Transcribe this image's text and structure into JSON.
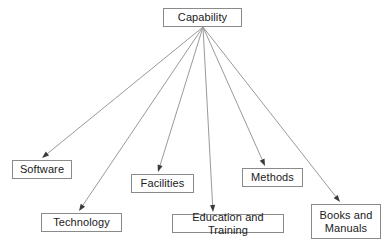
{
  "diagram": {
    "background_color": "#ffffff",
    "node_fill_color": "#ffffff",
    "node_border_color": "#8a8a8a",
    "edge_color": "#9a9a9a",
    "text_color": "#1a1a1a",
    "root": {
      "id": "capability",
      "label": "Capability",
      "x": 163,
      "y": 8,
      "w": 79,
      "h": 19
    },
    "nodes": [
      {
        "id": "software",
        "label": "Software",
        "x": 12,
        "y": 160,
        "w": 60,
        "h": 19
      },
      {
        "id": "technology",
        "label": "Technology",
        "x": 41,
        "y": 213,
        "w": 81,
        "h": 19
      },
      {
        "id": "facilities",
        "label": "Facilities",
        "x": 131,
        "y": 174,
        "w": 63,
        "h": 19
      },
      {
        "id": "education",
        "label": "Education and Training",
        "x": 172,
        "y": 214,
        "w": 112,
        "h": 19
      },
      {
        "id": "methods",
        "label": "Methods",
        "x": 242,
        "y": 168,
        "w": 61,
        "h": 19
      },
      {
        "id": "books",
        "label": "Books and\nManuals",
        "x": 311,
        "y": 204,
        "w": 70,
        "h": 35
      }
    ],
    "edges": [
      {
        "id": "edge-capability-software",
        "from": "capability",
        "to": "software",
        "x1": 203,
        "y1": 27,
        "x2": 42,
        "y2": 158
      },
      {
        "id": "edge-capability-technology",
        "from": "capability",
        "to": "technology",
        "x1": 203,
        "y1": 27,
        "x2": 79,
        "y2": 211
      },
      {
        "id": "edge-capability-facilities",
        "from": "capability",
        "to": "facilities",
        "x1": 203,
        "y1": 27,
        "x2": 158,
        "y2": 172
      },
      {
        "id": "edge-capability-education",
        "from": "capability",
        "to": "education",
        "x1": 203,
        "y1": 27,
        "x2": 213,
        "y2": 212
      },
      {
        "id": "edge-capability-methods",
        "from": "capability",
        "to": "methods",
        "x1": 203,
        "y1": 27,
        "x2": 265,
        "y2": 166
      },
      {
        "id": "edge-capability-books",
        "from": "capability",
        "to": "books",
        "x1": 203,
        "y1": 27,
        "x2": 340,
        "y2": 202
      }
    ]
  }
}
